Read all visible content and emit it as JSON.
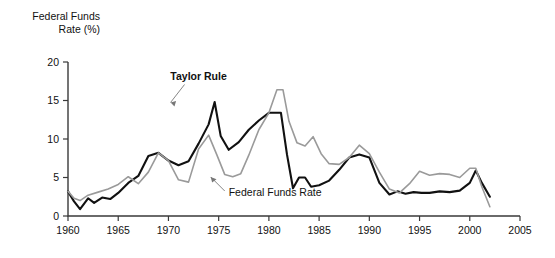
{
  "chart_data": {
    "type": "line",
    "title": "",
    "ylabel": "Federal Funds Rate (%)",
    "ylabel_line1": "Federal Funds",
    "ylabel_line2": "Rate (%)",
    "xlabel": "",
    "xlim": [
      1960,
      2005
    ],
    "ylim": [
      0,
      20
    ],
    "grid": false,
    "legend_position": "inline-annotations",
    "xticks": [
      1960,
      1965,
      1970,
      1975,
      1980,
      1985,
      1990,
      1995,
      2000,
      2005
    ],
    "xtick_labels": [
      "1960",
      "1965",
      "1970",
      "1975",
      "1980",
      "1985",
      "1990",
      "1995",
      "2000",
      "2005"
    ],
    "yticks": [
      0,
      5,
      10,
      15,
      20
    ],
    "ytick_labels": [
      "0",
      "5",
      "10",
      "15",
      "20"
    ],
    "annotations": [
      {
        "text": "Taylor Rule",
        "bold": true,
        "series": "Taylor Rule",
        "x": 1973.0,
        "y": 17.6
      },
      {
        "text": "Federal Funds Rate",
        "bold": false,
        "series": "Federal Funds Rate",
        "x": 1976.0,
        "y": 2.6
      }
    ],
    "series": [
      {
        "name": "Taylor Rule",
        "color": "#111111",
        "x": [
          1960.0,
          1960.6,
          1961.2,
          1962.0,
          1962.6,
          1963.4,
          1964.2,
          1965.0,
          1966.0,
          1967.0,
          1968.0,
          1969.0,
          1970.0,
          1971.0,
          1972.0,
          1973.0,
          1974.0,
          1974.6,
          1975.2,
          1976.0,
          1977.0,
          1978.0,
          1979.0,
          1980.0,
          1980.6,
          1981.2,
          1981.8,
          1982.4,
          1983.0,
          1983.6,
          1984.2,
          1985.0,
          1986.0,
          1987.0,
          1988.0,
          1989.0,
          1990.0,
          1991.0,
          1992.0,
          1992.8,
          1993.6,
          1994.4,
          1995.2,
          1996.0,
          1997.0,
          1998.0,
          1999.0,
          2000.0,
          2000.6,
          2001.2,
          2002.0
        ],
        "values": [
          3.2,
          1.9,
          0.9,
          2.3,
          1.7,
          2.4,
          2.2,
          3.0,
          4.3,
          5.2,
          7.8,
          8.2,
          7.2,
          6.6,
          7.1,
          9.4,
          11.9,
          14.8,
          10.4,
          8.6,
          9.6,
          11.2,
          12.4,
          13.4,
          13.4,
          13.4,
          8.0,
          3.6,
          5.0,
          5.0,
          3.8,
          4.0,
          4.6,
          6.0,
          7.6,
          8.0,
          7.6,
          4.3,
          2.8,
          3.2,
          2.9,
          3.1,
          3.0,
          3.0,
          3.2,
          3.1,
          3.3,
          4.3,
          5.9,
          4.3,
          2.5
        ]
      },
      {
        "name": "Federal Funds Rate",
        "color": "#9a9a9a",
        "x": [
          1960.0,
          1960.6,
          1961.2,
          1962.0,
          1963.0,
          1964.0,
          1965.0,
          1966.0,
          1967.0,
          1968.0,
          1969.0,
          1970.0,
          1971.0,
          1972.0,
          1973.0,
          1974.0,
          1974.8,
          1975.6,
          1976.4,
          1977.2,
          1978.0,
          1979.0,
          1980.0,
          1980.8,
          1981.4,
          1982.0,
          1982.8,
          1983.6,
          1984.4,
          1985.2,
          1986.0,
          1987.0,
          1988.0,
          1989.0,
          1990.0,
          1991.0,
          1992.0,
          1993.0,
          1994.0,
          1995.0,
          1996.0,
          1997.0,
          1998.0,
          1999.0,
          2000.0,
          2000.6,
          2001.2,
          2002.0
        ],
        "values": [
          3.2,
          2.3,
          2.0,
          2.7,
          3.1,
          3.5,
          4.1,
          5.1,
          4.2,
          5.7,
          8.2,
          7.2,
          4.7,
          4.4,
          8.7,
          10.5,
          8.0,
          5.4,
          5.1,
          5.5,
          7.9,
          11.2,
          13.4,
          16.4,
          16.4,
          12.3,
          9.5,
          9.1,
          10.3,
          8.1,
          6.8,
          6.7,
          7.6,
          9.2,
          8.1,
          5.7,
          3.5,
          3.0,
          4.2,
          5.8,
          5.3,
          5.5,
          5.4,
          5.0,
          6.2,
          6.2,
          3.8,
          1.2
        ]
      }
    ]
  }
}
